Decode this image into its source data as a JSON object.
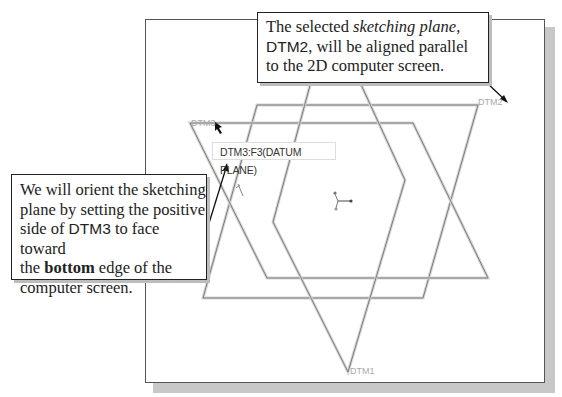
{
  "callouts": {
    "top": {
      "line1_pre": "The selected ",
      "line1_em": "sketching plane",
      "line1_post": ",",
      "line2_name": "DTM2",
      "line2_post": ", will be aligned parallel",
      "line3": "to the 2D computer screen."
    },
    "left": {
      "line1": "We will orient the sketching",
      "line2": "plane by setting the positive",
      "line3_pre": "side of ",
      "line3_name": "DTM3",
      "line3_post": " to face toward",
      "line4_pre": "the ",
      "line4_bold": "bottom",
      "line4_post": " edge of the",
      "line5": "computer screen."
    }
  },
  "viewport": {
    "tooltip": "DTM3:F3(DATUM PLANE)",
    "plane_labels": {
      "dtm1": "DTM1",
      "dtm2": "DTM2",
      "dtm3": "DTM3"
    },
    "icons": [
      "coordinate-triad-icon",
      "cursor-arrow-icon"
    ]
  },
  "colors": {
    "plane_edge": "#8a8a8a",
    "plane_edge_light": "#cfcfcf",
    "callout_border": "#222222",
    "shadow": "#c8c8c8"
  }
}
